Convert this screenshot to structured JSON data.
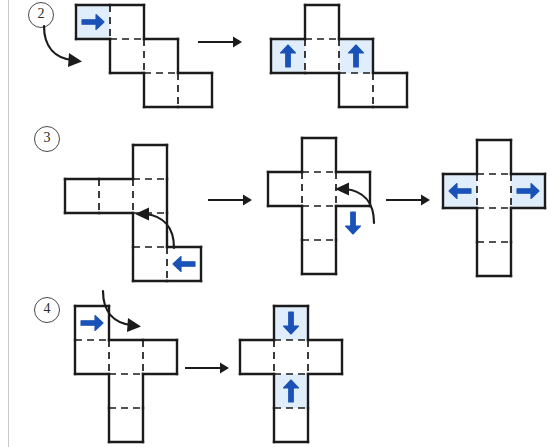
{
  "page": {
    "width": 558,
    "height": 447,
    "background": "#ffffff",
    "margin_rule_color": "#c9c9c9"
  },
  "colors": {
    "outline": "#1b1b1b",
    "fold_dash": "#1b1b1b",
    "arrow_blue": "#1a52b8",
    "highlight_fill": "#dfeefa",
    "transition_arrow": "#1b1b1b",
    "label_text": "#2b2b2b",
    "label_ring": "#4a4a4a"
  },
  "rows": [
    {
      "id": "row-2",
      "label": "2",
      "label_pos": {
        "x": 28,
        "y": 2
      },
      "stages": [
        {
          "id": "row2-stage1",
          "name": "staircase-net-before",
          "origin": {
            "x": 73,
            "y": 2
          },
          "cell": 34,
          "cells": [
            {
              "cx": 0,
              "cy": 0,
              "w": 2,
              "h": 1,
              "highlight": false
            },
            {
              "cx": 1,
              "cy": 1,
              "w": 2,
              "h": 1,
              "highlight": false
            },
            {
              "cx": 2,
              "cy": 2,
              "w": 2,
              "h": 1,
              "highlight": false
            }
          ],
          "arrows": [
            {
              "type": "fold",
              "dir": "right",
              "cx": 0.5,
              "cy": 0.5,
              "highlight_cell": {
                "cx": 0,
                "cy": 0,
                "w": 1,
                "h": 1
              }
            }
          ],
          "rot_hint": {
            "type": "curved-down-right",
            "x": 42,
            "y": 22
          }
        },
        {
          "id": "row2-stage2",
          "name": "t-net-after",
          "origin": {
            "x": 268,
            "y": 2
          },
          "cell": 34,
          "cells": [
            {
              "cx": 1,
              "cy": 0,
              "w": 1,
              "h": 1,
              "highlight": false
            },
            {
              "cx": 0,
              "cy": 1,
              "w": 3,
              "h": 1,
              "highlight": false
            },
            {
              "cx": 2,
              "cy": 2,
              "w": 2,
              "h": 1,
              "highlight": false
            }
          ],
          "arrows": [
            {
              "type": "fold",
              "dir": "up",
              "cx": 0.5,
              "cy": 1.5,
              "highlight_cell": {
                "cx": 0,
                "cy": 1,
                "w": 1,
                "h": 1
              }
            },
            {
              "type": "fold",
              "dir": "up",
              "cx": 2.5,
              "cy": 1.5,
              "highlight_cell": {
                "cx": 2,
                "cy": 1,
                "w": 1,
                "h": 1
              }
            }
          ]
        }
      ],
      "transitions": [
        {
          "id": "row2-arrow-1",
          "x": 198,
          "y": 42,
          "length": 44
        }
      ]
    },
    {
      "id": "row-3",
      "label": "3",
      "label_pos": {
        "x": 34,
        "y": 126
      },
      "stages": [
        {
          "id": "row3-stage1",
          "name": "l-net-before",
          "origin": {
            "x": 62,
            "y": 142
          },
          "cell": 34,
          "cells": [
            {
              "cx": 2,
              "cy": 0,
              "w": 1,
              "h": 2,
              "highlight": false
            },
            {
              "cx": 0,
              "cy": 1,
              "w": 2,
              "h": 1,
              "highlight": false
            },
            {
              "cx": 2,
              "cy": 2,
              "w": 1,
              "h": 2,
              "highlight": false
            },
            {
              "cx": 3,
              "cy": 3,
              "w": 1,
              "h": 1,
              "highlight": false
            }
          ],
          "arrows": [
            {
              "type": "fold",
              "dir": "left",
              "cx": 3.5,
              "cy": 3.5,
              "highlight_cell": null
            }
          ],
          "rot_hint": {
            "type": "curved-up-left",
            "x": 122,
            "y": 206
          }
        },
        {
          "id": "row3-stage2",
          "name": "cross-net-mid",
          "origin": {
            "x": 265,
            "y": 135
          },
          "cell": 34,
          "cells": [
            {
              "cx": 1,
              "cy": 0,
              "w": 1,
              "h": 2,
              "highlight": false
            },
            {
              "cx": 0,
              "cy": 1,
              "w": 3,
              "h": 1,
              "highlight": false
            },
            {
              "cx": 1,
              "cy": 2,
              "w": 1,
              "h": 2,
              "highlight": false
            }
          ],
          "arrows": [
            {
              "type": "fold",
              "dir": "down",
              "cx": 2.5,
              "cy": 2.5,
              "highlight_cell": null
            }
          ],
          "rot_hint": {
            "type": "curved-up-left",
            "x": 322,
            "y": 181
          }
        },
        {
          "id": "row3-stage3",
          "name": "cross-net-after",
          "origin": {
            "x": 440,
            "y": 137
          },
          "cell": 34,
          "cells": [
            {
              "cx": 1,
              "cy": 0,
              "w": 1,
              "h": 1,
              "highlight": false
            },
            {
              "cx": 0,
              "cy": 1,
              "w": 3,
              "h": 1,
              "highlight": false
            },
            {
              "cx": 1,
              "cy": 2,
              "w": 1,
              "h": 2,
              "highlight": false
            }
          ],
          "arrows": [
            {
              "type": "fold",
              "dir": "left",
              "cx": 0.5,
              "cy": 1.5,
              "highlight_cell": {
                "cx": 0,
                "cy": 1,
                "w": 1,
                "h": 1
              }
            },
            {
              "type": "fold",
              "dir": "right",
              "cx": 2.5,
              "cy": 1.5,
              "highlight_cell": {
                "cx": 2,
                "cy": 1,
                "w": 1,
                "h": 1
              }
            }
          ]
        }
      ],
      "transitions": [
        {
          "id": "row3-arrow-1",
          "x": 208,
          "y": 200,
          "length": 44
        },
        {
          "id": "row3-arrow-2",
          "x": 386,
          "y": 200,
          "length": 44
        }
      ]
    },
    {
      "id": "row-4",
      "label": "4",
      "label_pos": {
        "x": 34,
        "y": 297
      },
      "stages": [
        {
          "id": "row4-stage1",
          "name": "t-net-before",
          "origin": {
            "x": 72,
            "y": 303
          },
          "cell": 34,
          "cells": [
            {
              "cx": 0,
              "cy": 0,
              "w": 1,
              "h": 1,
              "highlight": false
            },
            {
              "cx": 0,
              "cy": 1,
              "w": 3,
              "h": 1,
              "highlight": false
            },
            {
              "cx": 1,
              "cy": 2,
              "w": 1,
              "h": 2,
              "highlight": false
            }
          ],
          "arrows": [
            {
              "type": "fold",
              "dir": "right",
              "cx": 0.5,
              "cy": 0.5,
              "highlight_cell": null
            }
          ],
          "rot_hint": {
            "type": "curved-down-right",
            "x": 101,
            "y": 287
          }
        },
        {
          "id": "row4-stage2",
          "name": "cross-net-after",
          "origin": {
            "x": 237,
            "y": 303
          },
          "cell": 34,
          "cells": [
            {
              "cx": 1,
              "cy": 0,
              "w": 1,
              "h": 1,
              "highlight": false
            },
            {
              "cx": 0,
              "cy": 1,
              "w": 3,
              "h": 1,
              "highlight": false
            },
            {
              "cx": 1,
              "cy": 2,
              "w": 1,
              "h": 2,
              "highlight": false
            }
          ],
          "arrows": [
            {
              "type": "fold",
              "dir": "down",
              "cx": 1.5,
              "cy": 0.5,
              "highlight_cell": {
                "cx": 1,
                "cy": 0,
                "w": 1,
                "h": 1
              }
            },
            {
              "type": "fold",
              "dir": "up",
              "cx": 1.5,
              "cy": 2.5,
              "highlight_cell": {
                "cx": 1,
                "cy": 2,
                "w": 1,
                "h": 1
              }
            }
          ]
        }
      ],
      "transitions": [
        {
          "id": "row4-arrow-1",
          "x": 185,
          "y": 368,
          "length": 44
        }
      ]
    }
  ]
}
